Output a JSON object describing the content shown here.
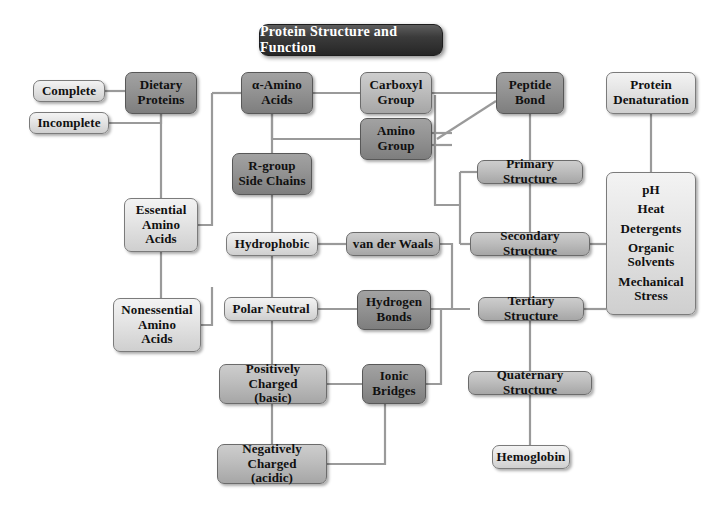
{
  "diagram": {
    "title": "Protein Structure and Function",
    "type": "concept-map",
    "background": "#ffffff",
    "palette": {
      "title_fill": "#2b2b2b",
      "title_text": "#ffffff",
      "light_box": "#e4e4e4",
      "mid_box": "#bdbdbd",
      "dark_box": "#939393",
      "border": "#6f6f6f",
      "connector": "#8a8a8a",
      "text": "#101010"
    }
  },
  "nodes": [
    {
      "id": "complete",
      "label": "Complete",
      "tone": "light",
      "x": 33,
      "y": 80,
      "w": 72,
      "h": 22,
      "font": 13
    },
    {
      "id": "incomplete",
      "label": "Incomplete",
      "tone": "light",
      "x": 29,
      "y": 112,
      "w": 80,
      "h": 22,
      "font": 13
    },
    {
      "id": "dietary",
      "label": "Dietary\nProteins",
      "tone": "dark",
      "x": 125,
      "y": 72,
      "w": 72,
      "h": 42,
      "font": 13
    },
    {
      "id": "alpha",
      "label": "α-Amino\nAcids",
      "tone": "dark",
      "x": 241,
      "y": 72,
      "w": 72,
      "h": 42,
      "font": 13
    },
    {
      "id": "carboxyl",
      "label": "Carboxyl\nGroup",
      "tone": "mid",
      "x": 360,
      "y": 72,
      "w": 72,
      "h": 42,
      "font": 13
    },
    {
      "id": "amino",
      "label": "Amino\nGroup",
      "tone": "dark",
      "x": 360,
      "y": 118,
      "w": 72,
      "h": 42,
      "font": 13
    },
    {
      "id": "peptide",
      "label": "Peptide\nBond",
      "tone": "dark",
      "x": 496,
      "y": 72,
      "w": 68,
      "h": 42,
      "font": 13
    },
    {
      "id": "denaturation",
      "label": "Protein\nDenaturation",
      "tone": "light",
      "x": 606,
      "y": 72,
      "w": 90,
      "h": 42,
      "font": 13
    },
    {
      "id": "rgroup",
      "label": "R-group\nSide Chains",
      "tone": "dark",
      "x": 232,
      "y": 153,
      "w": 80,
      "h": 42,
      "font": 13
    },
    {
      "id": "essential",
      "label": "Essential\nAmino\nAcids",
      "tone": "light",
      "x": 124,
      "y": 198,
      "w": 74,
      "h": 54,
      "font": 13
    },
    {
      "id": "nonessential",
      "label": "Nonessential\nAmino\nAcids",
      "tone": "light",
      "x": 113,
      "y": 298,
      "w": 88,
      "h": 54,
      "font": 13
    },
    {
      "id": "hydrophobic",
      "label": "Hydrophobic",
      "tone": "light",
      "x": 226,
      "y": 232,
      "w": 92,
      "h": 24,
      "font": 13
    },
    {
      "id": "polarneutral",
      "label": "Polar Neutral",
      "tone": "light",
      "x": 224,
      "y": 297,
      "w": 94,
      "h": 24,
      "font": 13
    },
    {
      "id": "positive",
      "label": "Positively Charged\n(basic)",
      "tone": "mid",
      "x": 219,
      "y": 364,
      "w": 108,
      "h": 40,
      "font": 13
    },
    {
      "id": "negative",
      "label": "Negatively Charged\n(acidic)",
      "tone": "mid",
      "x": 217,
      "y": 444,
      "w": 110,
      "h": 40,
      "font": 13
    },
    {
      "id": "vanderwaals",
      "label": "van der Waals",
      "tone": "mid",
      "x": 346,
      "y": 232,
      "w": 94,
      "h": 24,
      "font": 13
    },
    {
      "id": "hydrogenbonds",
      "label": "Hydrogen\nBonds",
      "tone": "dark",
      "x": 357,
      "y": 290,
      "w": 74,
      "h": 40,
      "font": 13
    },
    {
      "id": "ionicbridges",
      "label": "Ionic\nBridges",
      "tone": "dark",
      "x": 362,
      "y": 364,
      "w": 64,
      "h": 40,
      "font": 13
    },
    {
      "id": "primary",
      "label": "Primary Structure",
      "tone": "mid",
      "x": 477,
      "y": 160,
      "w": 106,
      "h": 24,
      "font": 13
    },
    {
      "id": "secondary",
      "label": "Secondary Structure",
      "tone": "mid",
      "x": 470,
      "y": 232,
      "w": 120,
      "h": 24,
      "font": 13
    },
    {
      "id": "tertiary",
      "label": "Tertiary Structure",
      "tone": "mid",
      "x": 478,
      "y": 297,
      "w": 106,
      "h": 24,
      "font": 13
    },
    {
      "id": "quaternary",
      "label": "Quaternary Structure",
      "tone": "mid",
      "x": 468,
      "y": 371,
      "w": 124,
      "h": 24,
      "font": 13
    },
    {
      "id": "hemoglobin",
      "label": "Hemoglobin",
      "tone": "light",
      "x": 492,
      "y": 445,
      "w": 78,
      "h": 24,
      "font": 13
    }
  ],
  "denaturation_agents": {
    "id": "agents",
    "items": [
      "pH",
      "Heat",
      "Detergents",
      "Organic Solvents",
      "Mechanical Stress"
    ],
    "tone": "light",
    "x": 606,
    "y": 172,
    "w": 90,
    "h": 143,
    "font": 13
  },
  "title_box": {
    "x": 259,
    "y": 24,
    "w": 182,
    "h": 30,
    "font": 14
  },
  "edges": [
    {
      "from": "complete",
      "to": "dietary",
      "style": "elbow"
    },
    {
      "from": "incomplete",
      "to": "dietary",
      "style": "elbow"
    },
    {
      "from": "dietary",
      "to": "essential",
      "style": "vertical"
    },
    {
      "from": "dietary",
      "to": "nonessential",
      "style": "vertical"
    },
    {
      "from": "essential",
      "to": "alpha",
      "style": "bracket"
    },
    {
      "from": "nonessential",
      "to": "alpha",
      "style": "bracket"
    },
    {
      "from": "alpha",
      "to": "carboxyl",
      "style": "horizontal"
    },
    {
      "from": "alpha",
      "to": "amino",
      "style": "elbow"
    },
    {
      "from": "alpha",
      "to": "rgroup",
      "style": "vertical"
    },
    {
      "from": "carboxyl",
      "to": "peptide",
      "style": "horizontal"
    },
    {
      "from": "amino",
      "to": "peptide",
      "style": "diagonal"
    },
    {
      "from": "carboxyl",
      "to": "primary",
      "style": "elbow"
    },
    {
      "from": "amino",
      "to": "secondary",
      "style": "elbow"
    },
    {
      "from": "peptide",
      "to": "primary",
      "style": "vertical"
    },
    {
      "from": "primary",
      "to": "secondary",
      "style": "vertical"
    },
    {
      "from": "secondary",
      "to": "tertiary",
      "style": "vertical"
    },
    {
      "from": "tertiary",
      "to": "quaternary",
      "style": "vertical"
    },
    {
      "from": "quaternary",
      "to": "hemoglobin",
      "style": "vertical"
    },
    {
      "from": "rgroup",
      "to": "hydrophobic",
      "style": "vertical"
    },
    {
      "from": "hydrophobic",
      "to": "polarneutral",
      "style": "vertical"
    },
    {
      "from": "polarneutral",
      "to": "positive",
      "style": "vertical"
    },
    {
      "from": "positive",
      "to": "negative",
      "style": "vertical"
    },
    {
      "from": "hydrophobic",
      "to": "vanderwaals",
      "style": "horizontal"
    },
    {
      "from": "polarneutral",
      "to": "hydrogenbonds",
      "style": "horizontal"
    },
    {
      "from": "positive",
      "to": "ionicbridges",
      "style": "horizontal"
    },
    {
      "from": "negative",
      "to": "ionicbridges",
      "style": "elbow"
    },
    {
      "from": "vanderwaals",
      "to": "secondary",
      "style": "elbow"
    },
    {
      "from": "hydrogenbonds",
      "to": "tertiary",
      "style": "horizontal"
    },
    {
      "from": "ionicbridges",
      "to": "tertiary",
      "style": "elbow"
    },
    {
      "from": "denaturation",
      "to": "agents",
      "style": "vertical"
    },
    {
      "from": "secondary",
      "to": "agents",
      "style": "horizontal"
    },
    {
      "from": "tertiary",
      "to": "agents",
      "style": "horizontal"
    }
  ]
}
